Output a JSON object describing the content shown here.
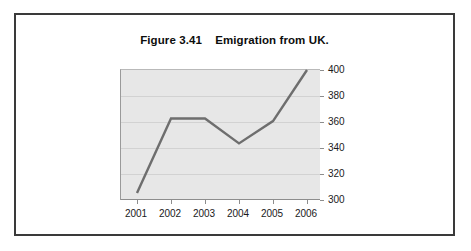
{
  "figure": {
    "title": "Figure 3.41    Emigration from UK.",
    "border_color": "#3a3a3a",
    "background": "#ffffff"
  },
  "chart_data": {
    "type": "line",
    "title": "Figure 3.41    Emigration from UK.",
    "xlabel": "",
    "ylabel": "",
    "categories": [
      "2001",
      "2002",
      "2003",
      "2004",
      "2005",
      "2006"
    ],
    "x": [
      2001,
      2002,
      2003,
      2004,
      2005,
      2006
    ],
    "values": [
      306,
      363,
      363,
      344,
      361,
      400
    ],
    "series": [
      {
        "name": "Emigration from UK",
        "values": [
          306,
          363,
          363,
          344,
          361,
          400
        ],
        "color": "#6e6e6e"
      }
    ],
    "ylim": [
      300,
      400
    ],
    "yticks": [
      300,
      320,
      340,
      360,
      380,
      400
    ],
    "ytick_labels": [
      "300",
      "320",
      "340",
      "360",
      "380",
      "400"
    ],
    "xtick_labels": [
      "2001",
      "2002",
      "2003",
      "2004",
      "2005",
      "2006"
    ],
    "y_axis_position": "right",
    "grid": true,
    "grid_color": "#d2d2d2",
    "plot_background": "#e7e7e7",
    "legend": false,
    "legend_position": "none"
  }
}
